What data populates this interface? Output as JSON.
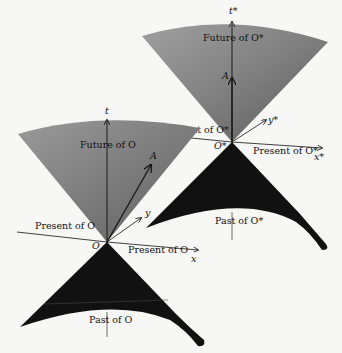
{
  "diagram": {
    "frame_o": {
      "origin_label": "O",
      "t_axis_label": "t",
      "x_axis_label": "x",
      "y_axis_label": "y",
      "vector_label": "A",
      "future_label": "Future of O",
      "past_label": "Past of O",
      "present_left_label": "Present of O",
      "present_right_label": "Present of O"
    },
    "frame_o_star": {
      "origin_label": "O*",
      "t_axis_label": "t*",
      "x_axis_label": "x*",
      "y_axis_label": "y*",
      "vector_label": "A",
      "future_label": "Future of O*",
      "past_label": "Past of O*",
      "present_left_label": "Present of O*",
      "present_right_label": "Present of O*"
    },
    "colors": {
      "future_cone_light": "#a8a8a8",
      "future_cone_dark": "#6a6a6a",
      "past_cone": "#111111",
      "background": "#f7f7f5",
      "axis": "#111111"
    }
  }
}
